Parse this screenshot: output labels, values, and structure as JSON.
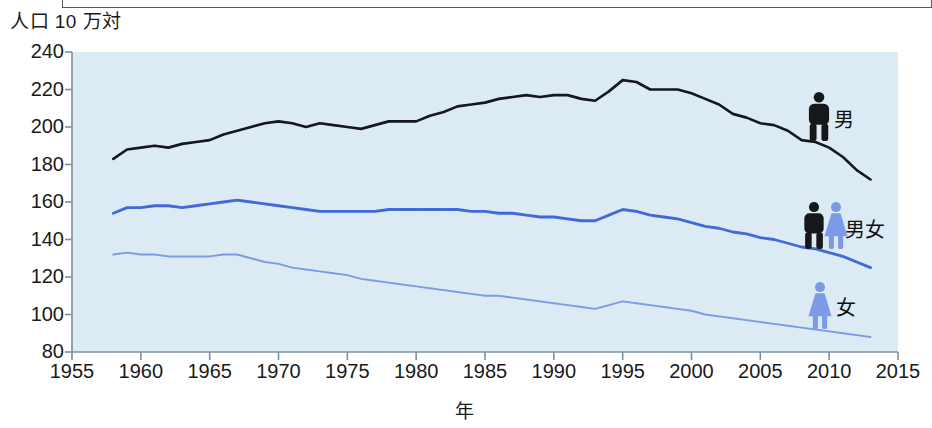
{
  "chart_data": {
    "type": "line",
    "title": "",
    "ylabel": "人口 10 万対",
    "xlabel": "年",
    "xlim": [
      1955,
      2015
    ],
    "ylim": [
      80,
      240
    ],
    "xticks": [
      1955,
      1960,
      1965,
      1970,
      1975,
      1980,
      1985,
      1990,
      1995,
      2000,
      2005,
      2010,
      2015
    ],
    "yticks": [
      80,
      100,
      120,
      140,
      160,
      180,
      200,
      220,
      240
    ],
    "grid": false,
    "legend_position": "right-inside",
    "plot_background": "#daeaf4",
    "x": [
      1958,
      1959,
      1960,
      1961,
      1962,
      1963,
      1964,
      1965,
      1966,
      1967,
      1968,
      1969,
      1970,
      1971,
      1972,
      1973,
      1974,
      1975,
      1976,
      1977,
      1978,
      1979,
      1980,
      1981,
      1982,
      1983,
      1984,
      1985,
      1986,
      1987,
      1988,
      1989,
      1990,
      1991,
      1992,
      1993,
      1994,
      1995,
      1996,
      1997,
      1998,
      1999,
      2000,
      2001,
      2002,
      2003,
      2004,
      2005,
      2006,
      2007,
      2008,
      2009,
      2010,
      2011,
      2012,
      2013
    ],
    "series": [
      {
        "name": "男",
        "label": "男",
        "color": "#15171a",
        "icon": "male-figure-icon",
        "values": [
          183,
          188,
          189,
          190,
          189,
          191,
          192,
          193,
          196,
          198,
          200,
          202,
          203,
          202,
          200,
          202,
          201,
          200,
          199,
          201,
          203,
          203,
          203,
          206,
          208,
          211,
          212,
          213,
          215,
          216,
          217,
          216,
          217,
          217,
          215,
          214,
          219,
          225,
          224,
          220,
          220,
          220,
          218,
          215,
          212,
          207,
          205,
          202,
          201,
          198,
          193,
          192,
          189,
          184,
          177,
          172
        ]
      },
      {
        "name": "男女",
        "label": "男女",
        "color": "#4169d8",
        "icon": "male-female-figure-icon",
        "values": [
          154,
          157,
          157,
          158,
          158,
          157,
          158,
          159,
          160,
          161,
          160,
          159,
          158,
          157,
          156,
          155,
          155,
          155,
          155,
          155,
          156,
          156,
          156,
          156,
          156,
          156,
          155,
          155,
          154,
          154,
          153,
          152,
          152,
          151,
          150,
          150,
          153,
          156,
          155,
          153,
          152,
          151,
          149,
          147,
          146,
          144,
          143,
          141,
          140,
          138,
          136,
          135,
          133,
          131,
          128,
          125
        ]
      },
      {
        "name": "女",
        "label": "女",
        "color": "#7d9ae8",
        "icon": "female-figure-icon",
        "values": [
          132,
          133,
          132,
          132,
          131,
          131,
          131,
          131,
          132,
          132,
          130,
          128,
          127,
          125,
          124,
          123,
          122,
          121,
          119,
          118,
          117,
          116,
          115,
          114,
          113,
          112,
          111,
          110,
          110,
          109,
          108,
          107,
          106,
          105,
          104,
          103,
          105,
          107,
          106,
          105,
          104,
          103,
          102,
          100,
          99,
          98,
          97,
          96,
          95,
          94,
          93,
          92,
          91,
          90,
          89,
          88
        ]
      }
    ]
  },
  "axes": {
    "ytick_labels": [
      "240",
      "220",
      "200",
      "180",
      "160",
      "140",
      "120",
      "100",
      "80"
    ],
    "xtick_labels": [
      "1955",
      "1960",
      "1965",
      "1970",
      "1975",
      "1980",
      "1985",
      "1990",
      "1995",
      "2000",
      "2005",
      "2010",
      "2015"
    ]
  },
  "legend": {
    "items": [
      {
        "label": "男",
        "icon": "male-figure-icon"
      },
      {
        "label": "男女",
        "icon": "male-female-figure-icon"
      },
      {
        "label": "女",
        "icon": "female-figure-icon"
      }
    ]
  },
  "colors": {
    "male_line": "#15171a",
    "both_line": "#4169d8",
    "female_line": "#7d9ae8",
    "plot_bg": "#daeaf4",
    "axis": "#7e8fa0",
    "text": "#1a1a1a"
  }
}
